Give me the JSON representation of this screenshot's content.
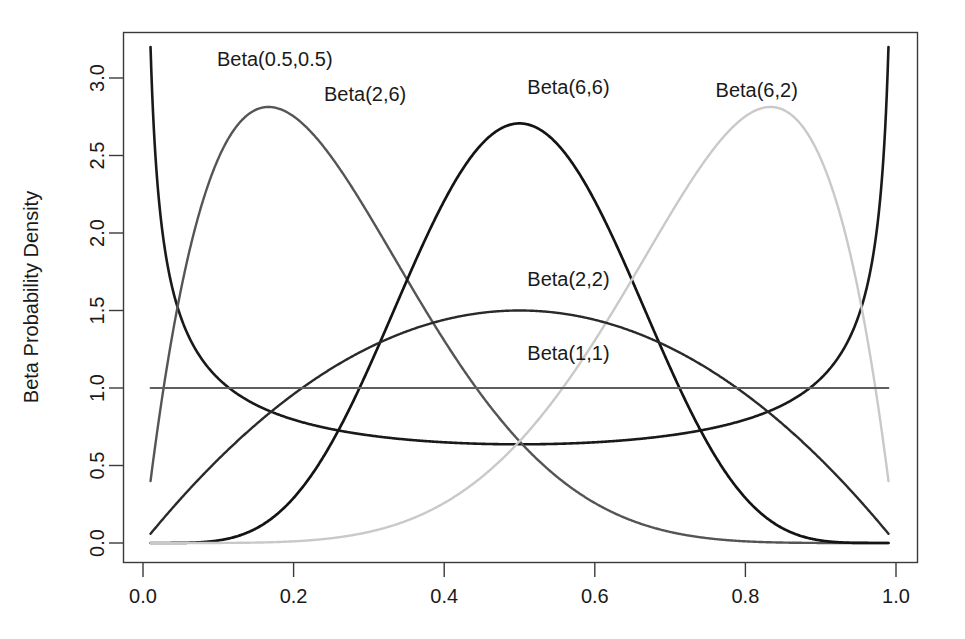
{
  "chart_data": {
    "type": "line",
    "title": "",
    "xlabel": "",
    "ylabel": "Beta Probability Density",
    "xlim": [
      0.0,
      1.0
    ],
    "ylim": [
      0.0,
      3.2
    ],
    "grid": false,
    "legend_position": "inline-annotations",
    "x_ticks": [
      "0.0",
      "0.2",
      "0.4",
      "0.6",
      "0.8",
      "1.0"
    ],
    "x_tick_values": [
      0.0,
      0.2,
      0.4,
      0.6,
      0.8,
      1.0
    ],
    "y_ticks": [
      "0.0",
      "0.5",
      "1.0",
      "1.5",
      "2.0",
      "2.5",
      "3.0"
    ],
    "y_tick_values": [
      0.0,
      0.5,
      1.0,
      1.5,
      2.0,
      2.5,
      3.0
    ],
    "x_domain_drawn": [
      0.01,
      0.99
    ],
    "series": [
      {
        "name": "Beta(0.5,0.5)",
        "alpha": 0.5,
        "beta": 0.5,
        "color": "#1a1a1a",
        "width": 2.6,
        "label": "Beta(0.5,0.5)",
        "label_x": 0.175,
        "label_y": 3.08,
        "key_points": [
          {
            "x": 0.01,
            "y": 3.2
          },
          {
            "x": 0.05,
            "y": 1.46
          },
          {
            "x": 0.1,
            "y": 1.06
          },
          {
            "x": 0.25,
            "y": 0.735
          },
          {
            "x": 0.5,
            "y": 0.637
          },
          {
            "x": 0.75,
            "y": 0.735
          },
          {
            "x": 0.9,
            "y": 1.06
          },
          {
            "x": 0.95,
            "y": 1.46
          },
          {
            "x": 0.99,
            "y": 3.2
          }
        ]
      },
      {
        "name": "Beta(2,6)",
        "alpha": 2,
        "beta": 6,
        "color": "#555555",
        "width": 2.4,
        "label": "Beta(2,6)",
        "label_x": 0.295,
        "label_y": 2.85,
        "key_points": [
          {
            "x": 0.01,
            "y": 0.405
          },
          {
            "x": 0.0667,
            "y": 1.93
          },
          {
            "x": 0.1667,
            "y": 2.8
          },
          {
            "x": 0.3,
            "y": 2.02
          },
          {
            "x": 0.5,
            "y": 0.656
          },
          {
            "x": 0.7,
            "y": 0.068
          },
          {
            "x": 0.9,
            "y": 0.0
          },
          {
            "x": 0.99,
            "y": 0.0
          }
        ]
      },
      {
        "name": "Beta(6,6)",
        "alpha": 6,
        "beta": 6,
        "color": "#141414",
        "width": 2.7,
        "label": "Beta(6,6)",
        "label_x": 0.565,
        "label_y": 2.9,
        "key_points": [
          {
            "x": 0.01,
            "y": 0.0
          },
          {
            "x": 0.2,
            "y": 0.254
          },
          {
            "x": 0.3,
            "y": 1.106
          },
          {
            "x": 0.4,
            "y": 2.137
          },
          {
            "x": 0.5,
            "y": 2.707
          },
          {
            "x": 0.6,
            "y": 2.137
          },
          {
            "x": 0.7,
            "y": 1.106
          },
          {
            "x": 0.8,
            "y": 0.254
          },
          {
            "x": 0.99,
            "y": 0.0
          }
        ]
      },
      {
        "name": "Beta(6,2)",
        "alpha": 6,
        "beta": 2,
        "color": "#c9c9c9",
        "width": 2.4,
        "label": "Beta(6,2)",
        "label_x": 0.815,
        "label_y": 2.88,
        "key_points": [
          {
            "x": 0.01,
            "y": 0.0
          },
          {
            "x": 0.3,
            "y": 0.068
          },
          {
            "x": 0.5,
            "y": 0.656
          },
          {
            "x": 0.7,
            "y": 2.02
          },
          {
            "x": 0.8333,
            "y": 2.8
          },
          {
            "x": 0.9333,
            "y": 1.93
          },
          {
            "x": 0.99,
            "y": 0.405
          }
        ]
      },
      {
        "name": "Beta(2,2)",
        "alpha": 2,
        "beta": 2,
        "color": "#2a2a2a",
        "width": 2.4,
        "label": "Beta(2,2)",
        "label_x": 0.565,
        "label_y": 1.66,
        "key_points": [
          {
            "x": 0.01,
            "y": 0.059
          },
          {
            "x": 0.1,
            "y": 0.54
          },
          {
            "x": 0.25,
            "y": 1.125
          },
          {
            "x": 0.5,
            "y": 1.5
          },
          {
            "x": 0.75,
            "y": 1.125
          },
          {
            "x": 0.9,
            "y": 0.54
          },
          {
            "x": 0.99,
            "y": 0.059
          }
        ]
      },
      {
        "name": "Beta(1,1)",
        "alpha": 1,
        "beta": 1,
        "color": "#5e5e5e",
        "width": 1.8,
        "label": "Beta(1,1)",
        "label_x": 0.565,
        "label_y": 1.18,
        "key_points": [
          {
            "x": 0.01,
            "y": 1.0
          },
          {
            "x": 0.99,
            "y": 1.0
          }
        ]
      }
    ]
  },
  "axes": {
    "y_title": "Beta Probability Density"
  }
}
